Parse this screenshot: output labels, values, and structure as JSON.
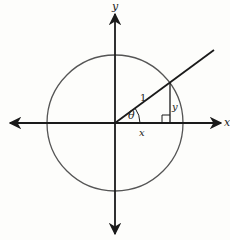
{
  "diagram": {
    "axes": {
      "x_label": "x",
      "y_label": "y"
    },
    "circle": {
      "radius_label": "1"
    },
    "triangle": {
      "angle_label": "θ",
      "adjacent_label": "x",
      "opposite_label": "y",
      "hypotenuse_label": "1"
    },
    "colors": {
      "stroke": "#1a1a1a",
      "circle": "#555555",
      "background": "#fdfdfb"
    }
  }
}
